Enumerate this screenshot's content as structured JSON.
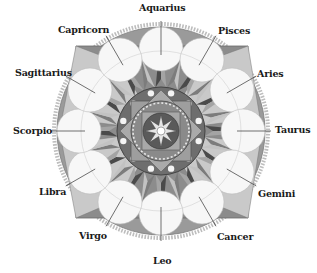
{
  "diagram": {
    "title": "",
    "type": "zodiac-mandala",
    "colors": {
      "background": "#ffffff",
      "dark": "#3a3a3a",
      "mid": "#8a8a8a",
      "light": "#c4c4c4",
      "lighter": "#dedede",
      "circle_fill": "#f7f7f7",
      "bead": "#bdbdbd",
      "label": "#1a1a1a"
    },
    "signs": [
      {
        "name": "Aquarius",
        "x": 139,
        "y": 3
      },
      {
        "name": "Pisces",
        "x": 218,
        "y": 26
      },
      {
        "name": "Aries",
        "x": 257,
        "y": 69
      },
      {
        "name": "Taurus",
        "x": 275,
        "y": 125
      },
      {
        "name": "Gemini",
        "x": 258,
        "y": 189
      },
      {
        "name": "Cancer",
        "x": 217,
        "y": 232
      },
      {
        "name": "Leo",
        "x": 153,
        "y": 256
      },
      {
        "name": "Virgo",
        "x": 79,
        "y": 231
      },
      {
        "name": "Libra",
        "x": 39,
        "y": 187
      },
      {
        "name": "Scorpio",
        "x": 13,
        "y": 126
      },
      {
        "name": "Sagittarius",
        "x": 15,
        "y": 68
      },
      {
        "name": "Capricorn",
        "x": 58,
        "y": 25
      }
    ]
  }
}
